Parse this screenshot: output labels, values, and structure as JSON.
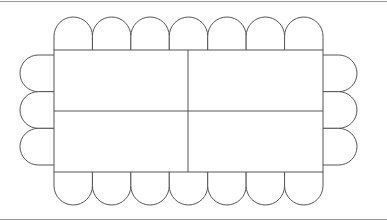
{
  "diagram": {
    "type": "seating-layout",
    "stroke_color": "#555555",
    "frame_color": "#9a9a9a",
    "table": {
      "x": 54,
      "y": 50,
      "width": 269,
      "height": 122,
      "sections": 4,
      "vertical_divider_x": 188,
      "horizontal_divider_y": 111
    },
    "chairs": {
      "top": 7,
      "bottom": 7,
      "left": 3,
      "right": 3,
      "total": 20
    }
  }
}
